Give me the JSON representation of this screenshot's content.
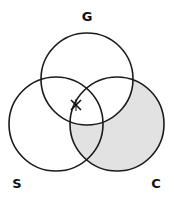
{
  "diagram": {
    "type": "venn",
    "sets": [
      {
        "id": "G",
        "label": "G",
        "cx": 87,
        "cy": 79,
        "r": 46
      },
      {
        "id": "S",
        "label": "S",
        "cx": 56,
        "cy": 124,
        "r": 47
      },
      {
        "id": "C",
        "label": "C",
        "cx": 117,
        "cy": 124,
        "r": 47
      }
    ],
    "shaded_region": "C minus G",
    "shade_color": "#e2e2e2",
    "stroke_color": "#1a1a1a",
    "marker": {
      "symbol": "✕",
      "description": "x mark on C boundary inside G and S",
      "x": 76,
      "y": 105
    }
  }
}
